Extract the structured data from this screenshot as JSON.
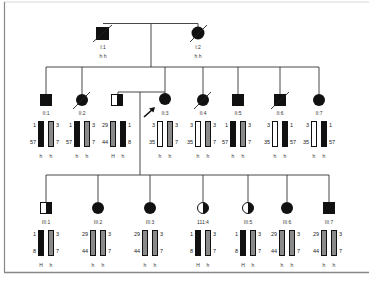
{
  "colors": {
    "line": "#333333",
    "affected": "#111111",
    "haplotype_black": "#111111",
    "haplotype_grey": "#8a8a8a",
    "haplotype_white": "#ffffff",
    "frame": "#888888"
  },
  "generation_I": [
    {
      "id": "I:1",
      "sex": "male",
      "status": "affected",
      "deceased": true,
      "x": 103,
      "y": 33,
      "haplotype_labels": "h h"
    },
    {
      "id": "I:2",
      "sex": "female",
      "status": "affected",
      "deceased": true,
      "x": 198,
      "y": 33,
      "haplotype_labels": "h h"
    }
  ],
  "generation_II": [
    {
      "id": "II:1",
      "sex": "male",
      "status": "affected",
      "deceased": false,
      "x": 46,
      "bars": [
        {
          "color": "black",
          "top": "1",
          "bottom": "57",
          "side": "left"
        },
        {
          "color": "grey",
          "top": "3",
          "bottom": "7",
          "side": "right"
        }
      ],
      "h": [
        "h",
        "h"
      ]
    },
    {
      "id": "II:2",
      "sex": "female",
      "status": "affected",
      "deceased": true,
      "x": 82,
      "bars": [
        {
          "color": "black",
          "top": "1",
          "bottom": "57",
          "side": "left"
        },
        {
          "color": "grey",
          "top": "3",
          "bottom": "7",
          "side": "right"
        }
      ],
      "h": [
        "h",
        "h"
      ]
    },
    {
      "id": "",
      "sex": "male",
      "status": "carrier-half",
      "deceased": false,
      "x": 118,
      "spouse": true,
      "bars": [
        {
          "color": "grey",
          "top": "29",
          "bottom": "44",
          "side": "left"
        },
        {
          "color": "black",
          "top": "1",
          "bottom": "8",
          "side": "right"
        }
      ],
      "h": [
        "H",
        "h"
      ]
    },
    {
      "id": "II:3",
      "sex": "female",
      "status": "affected",
      "deceased": false,
      "x": 165,
      "proband": true,
      "bars": [
        {
          "color": "white",
          "top": "3",
          "bottom": "35",
          "side": "left"
        },
        {
          "color": "grey",
          "top": "3",
          "bottom": "7",
          "side": "right"
        }
      ],
      "h": [
        "h",
        "h"
      ]
    },
    {
      "id": "II:4",
      "sex": "female",
      "status": "affected",
      "deceased": true,
      "x": 203,
      "bars": [
        {
          "color": "white",
          "top": "3",
          "bottom": "35",
          "side": "left"
        },
        {
          "color": "grey",
          "top": "3",
          "bottom": "7",
          "side": "right"
        }
      ],
      "h": [
        "h",
        "h"
      ]
    },
    {
      "id": "II:5",
      "sex": "male",
      "status": "affected",
      "deceased": false,
      "x": 238,
      "bars": [
        {
          "color": "black",
          "top": "1",
          "bottom": "57",
          "side": "left"
        },
        {
          "color": "grey",
          "top": "3",
          "bottom": "7",
          "side": "right"
        }
      ],
      "h": [
        "h",
        "h"
      ]
    },
    {
      "id": "II:6",
      "sex": "male",
      "status": "affected",
      "deceased": true,
      "x": 280,
      "bars": [
        {
          "color": "white",
          "top": "3",
          "bottom": "35",
          "side": "left"
        },
        {
          "color": "black",
          "top": "1",
          "bottom": "57",
          "side": "right"
        }
      ],
      "h": [
        "h",
        "h"
      ]
    },
    {
      "id": "II:7",
      "sex": "female",
      "status": "affected",
      "deceased": false,
      "x": 319,
      "bars": [
        {
          "color": "white",
          "top": "3",
          "bottom": "35",
          "side": "left"
        },
        {
          "color": "black",
          "top": "1",
          "bottom": "57",
          "side": "right"
        }
      ],
      "h": [
        "h",
        "h"
      ]
    }
  ],
  "generation_III": [
    {
      "id": "III:1",
      "sex": "male",
      "status": "carrier-half",
      "x": 46,
      "bars": [
        {
          "color": "black",
          "top": "1",
          "bottom": "8",
          "side": "left"
        },
        {
          "color": "grey",
          "top": "3",
          "bottom": "7",
          "side": "right"
        }
      ],
      "h": [
        "H",
        "h"
      ]
    },
    {
      "id": "III:2",
      "sex": "female",
      "status": "affected",
      "x": 98,
      "bars": [
        {
          "color": "grey",
          "top": "29",
          "bottom": "44",
          "side": "left"
        },
        {
          "color": "grey",
          "top": "3",
          "bottom": "7",
          "side": "right"
        }
      ],
      "h": [
        "h",
        "h"
      ]
    },
    {
      "id": "III:3",
      "sex": "female",
      "status": "affected",
      "x": 150,
      "bars": [
        {
          "color": "grey",
          "top": "29",
          "bottom": "44",
          "side": "left"
        },
        {
          "color": "grey",
          "top": "3",
          "bottom": "7",
          "side": "right"
        }
      ],
      "h": [
        "h",
        "h"
      ]
    },
    {
      "id": "111:4",
      "sex": "female",
      "status": "carrier-half",
      "x": 203,
      "bars": [
        {
          "color": "black",
          "top": "1",
          "bottom": "8",
          "side": "left"
        },
        {
          "color": "grey",
          "top": "3",
          "bottom": "7",
          "side": "right"
        }
      ],
      "h": [
        "H",
        "h"
      ]
    },
    {
      "id": "III:5",
      "sex": "female",
      "status": "carrier-half",
      "x": 248,
      "bars": [
        {
          "color": "black",
          "top": "1",
          "bottom": "8",
          "side": "left"
        },
        {
          "color": "grey",
          "top": "3",
          "bottom": "7",
          "side": "right"
        }
      ],
      "h": [
        "H",
        "h"
      ]
    },
    {
      "id": "III:6",
      "sex": "female",
      "status": "affected",
      "x": 287,
      "bars": [
        {
          "color": "grey",
          "top": "29",
          "bottom": "44",
          "side": "left"
        },
        {
          "color": "grey",
          "top": "3",
          "bottom": "7",
          "side": "right"
        }
      ],
      "h": [
        "h",
        "h"
      ]
    },
    {
      "id": "III:7",
      "sex": "male",
      "status": "affected",
      "x": 329,
      "bars": [
        {
          "color": "grey",
          "top": "29",
          "bottom": "44",
          "side": "left"
        },
        {
          "color": "grey",
          "top": "3",
          "bottom": "7",
          "side": "right"
        }
      ],
      "h": [
        "h",
        "h"
      ]
    }
  ]
}
